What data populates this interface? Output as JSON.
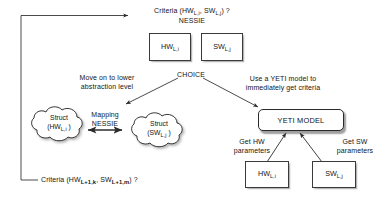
{
  "diagram": {
    "title_top": "Criteria (HW L,i , SW L,j) ?",
    "method_top": "NESSIE"
  },
  "top": {
    "criteria_prefix": "Criteria (HW",
    "criteria_sub1": "L,i",
    "criteria_mid": ", SW",
    "criteria_sub2": "L,j",
    "criteria_suffix": ") ?",
    "nessie": "NESSIE"
  },
  "boxes": {
    "hw_top": {
      "label": "HW",
      "sub": "L,i"
    },
    "sw_top": {
      "label": "SW",
      "sub": "L,j"
    },
    "hw_bottom": {
      "label": "HW",
      "sub": "L,i"
    },
    "sw_bottom": {
      "label": "SW",
      "sub": "L,j"
    }
  },
  "choice": {
    "label": "CHOICE",
    "left_branch_line1": "Move on to lower",
    "left_branch_line2": "abstraction level",
    "right_branch_line1": "Use a YETI model to",
    "right_branch_line2": "immediately get criteria"
  },
  "clouds": {
    "hw_struct": {
      "line1": "Struct",
      "line2_prefix": "(HW",
      "line2_sub": "L,i",
      "line2_suffix": " )"
    },
    "sw_struct": {
      "line1": "Struct",
      "line2_prefix": "(SW",
      "line2_sub": "L,j",
      "line2_suffix": " )"
    }
  },
  "mapping": {
    "line1": "Mapping",
    "line2": "NESSIE"
  },
  "yeti": {
    "label": "YETI MODEL",
    "get_hw_line1": "Get HW",
    "get_hw_line2": "parameters",
    "get_sw_line1": "Get SW",
    "get_sw_line2": "parameters"
  },
  "feedback": {
    "prefix": "Criteria (HW",
    "sub1": "L+1,k",
    "mid": ", SW",
    "sub2": "L+1,m",
    "suffix": ") ?"
  },
  "colors": {
    "line": "#2b2b2b",
    "text": "#151515",
    "background": "#ffffff"
  }
}
